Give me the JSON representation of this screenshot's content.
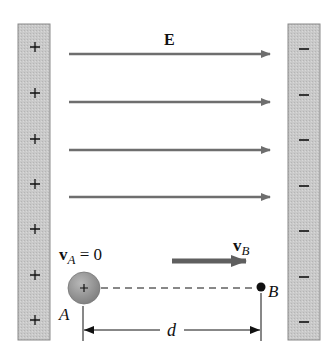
{
  "diagram": {
    "field_label": "E",
    "left_plate": {
      "charge_sign": "+",
      "charge_count": 7,
      "fill": "#c9c9c9",
      "stroke": "#8a8a8a"
    },
    "right_plate": {
      "charge_sign": "−",
      "charge_count": 7,
      "fill": "#c9c9c9",
      "stroke": "#8a8a8a"
    },
    "field_arrows_count": 4,
    "field_arrow_color": "#6e6e6e",
    "charge": {
      "sign": "+",
      "fill": "#9a9a9a"
    },
    "velocity_A": {
      "symbol": "v",
      "subscript": "A",
      "rest": " = 0"
    },
    "velocity_B": {
      "symbol": "v",
      "subscript": "B"
    },
    "velocity_arrow_color": "#5f5f5f",
    "point_A_label": "A",
    "point_B_label": "B",
    "distance_label": "d"
  }
}
